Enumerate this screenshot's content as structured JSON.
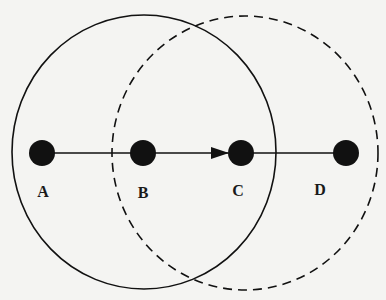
{
  "diagram": {
    "type": "network-range-diagram",
    "background": "#f4f4f2",
    "ink": "#111111",
    "nodes": [
      {
        "id": "A",
        "label": "A",
        "cx": 42,
        "cy": 153,
        "r": 13,
        "label_x": 43,
        "label_y": 197
      },
      {
        "id": "B",
        "label": "B",
        "cx": 143,
        "cy": 153,
        "r": 13,
        "label_x": 143,
        "label_y": 198
      },
      {
        "id": "C",
        "label": "C",
        "cx": 241,
        "cy": 153,
        "r": 13,
        "label_x": 238,
        "label_y": 196
      },
      {
        "id": "D",
        "label": "D",
        "cx": 346,
        "cy": 153,
        "r": 13,
        "label_x": 320,
        "label_y": 195
      }
    ],
    "edges": [
      {
        "from": "A",
        "to": "B",
        "directed": false
      },
      {
        "from": "B",
        "to": "C",
        "directed": true
      },
      {
        "from": "C",
        "to": "D",
        "directed": false
      }
    ],
    "ranges": [
      {
        "name": "range-of-B",
        "center_node": "B",
        "style": "solid",
        "cx": 144,
        "cy": 152,
        "rx": 132,
        "ry": 137
      },
      {
        "name": "range-of-C",
        "center_node": "C",
        "style": "dashed",
        "cx": 245,
        "cy": 153,
        "rx": 133,
        "ry": 137
      }
    ]
  }
}
